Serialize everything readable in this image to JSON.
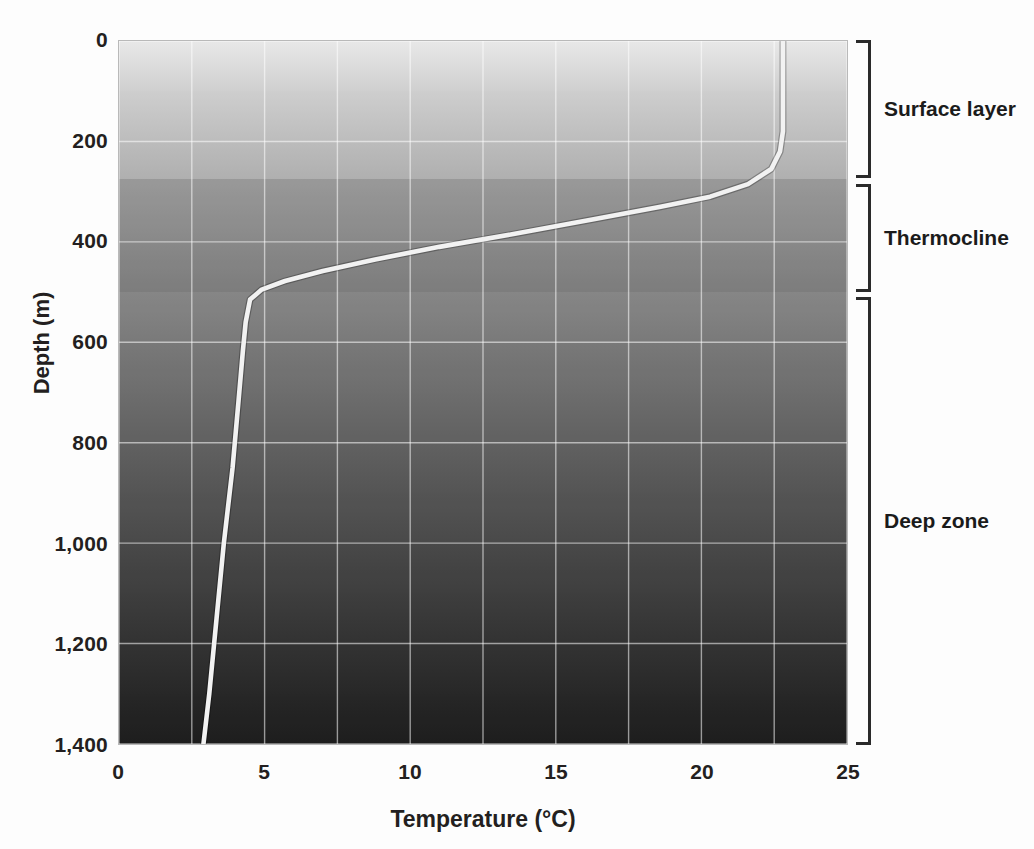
{
  "chart_data": {
    "type": "line",
    "title": "",
    "xlabel": "Temperature (°C)",
    "ylabel": "Depth (m)",
    "xlim": [
      0,
      25
    ],
    "ylim": [
      1400,
      0
    ],
    "y_inverted": true,
    "grid": true,
    "x_ticks": [
      0,
      5,
      10,
      15,
      20,
      25
    ],
    "x_tick_labels": [
      "0",
      "5",
      "10",
      "15",
      "20",
      "25"
    ],
    "x_gridlines": [
      0,
      2.5,
      5,
      7.5,
      10,
      12.5,
      15,
      17.5,
      20,
      22.5,
      25
    ],
    "y_ticks": [
      0,
      200,
      400,
      600,
      800,
      1000,
      1200,
      1400
    ],
    "y_tick_labels": [
      "0",
      "200",
      "400",
      "600",
      "800",
      "1,000",
      "1,200",
      "1,400"
    ],
    "y_gridlines": [
      0,
      200,
      400,
      600,
      800,
      1000,
      1200,
      1400
    ],
    "legend": [],
    "series": [
      {
        "name": "Temperature profile",
        "color": "#f2f2f2",
        "points": [
          {
            "temperature": 22.8,
            "depth": 0
          },
          {
            "temperature": 22.8,
            "depth": 100
          },
          {
            "temperature": 22.8,
            "depth": 180
          },
          {
            "temperature": 22.7,
            "depth": 220
          },
          {
            "temperature": 22.4,
            "depth": 255
          },
          {
            "temperature": 21.6,
            "depth": 285
          },
          {
            "temperature": 20.3,
            "depth": 310
          },
          {
            "temperature": 18.6,
            "depth": 330
          },
          {
            "temperature": 16.3,
            "depth": 355
          },
          {
            "temperature": 13.5,
            "depth": 385
          },
          {
            "temperature": 11.0,
            "depth": 410
          },
          {
            "temperature": 8.8,
            "depth": 435
          },
          {
            "temperature": 7.0,
            "depth": 458
          },
          {
            "temperature": 5.7,
            "depth": 478
          },
          {
            "temperature": 4.9,
            "depth": 495
          },
          {
            "temperature": 4.5,
            "depth": 515
          },
          {
            "temperature": 4.35,
            "depth": 560
          },
          {
            "temperature": 4.25,
            "depth": 620
          },
          {
            "temperature": 4.1,
            "depth": 720
          },
          {
            "temperature": 3.9,
            "depth": 850
          },
          {
            "temperature": 3.6,
            "depth": 1000
          },
          {
            "temperature": 3.35,
            "depth": 1150
          },
          {
            "temperature": 3.1,
            "depth": 1300
          },
          {
            "temperature": 2.9,
            "depth": 1400
          }
        ]
      }
    ],
    "zones": [
      {
        "name": "Surface layer",
        "depth_top": 0,
        "depth_bottom": 275
      },
      {
        "name": "Thermocline",
        "depth_top": 285,
        "depth_bottom": 500
      },
      {
        "name": "Deep zone",
        "depth_top": 510,
        "depth_bottom": 1400
      }
    ],
    "background": {
      "description": "vertical gradient from light gray at surface to near-black at depth",
      "top_color": "#e8e8e8",
      "bottom_color": "#1d1d1d"
    },
    "annotations": []
  },
  "zone_labels": {
    "surface": "Surface layer",
    "thermocline": "Thermocline",
    "deep": "Deep zone"
  },
  "ghost_text": {
    "line1": "What factors affect the surface temperature of the",
    "line2": "Appendix for answers.)"
  }
}
